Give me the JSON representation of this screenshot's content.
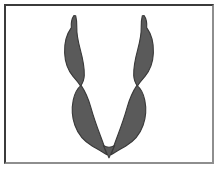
{
  "figure": {
    "background_color": "#ffffff",
    "frame": {
      "border_color_top_left": "#3b3b3b",
      "border_color_bottom_right": "#8e8e8e",
      "border_width": "2px",
      "inset": "4px"
    },
    "shape": {
      "fill_color": "#5a5a5a",
      "outline_color": "#3a3a3a",
      "outline_width": 1.2,
      "lobe_count": 4
    },
    "lobes": [
      {
        "name": "upper-left-lobe",
        "position": "upper left arm",
        "tip": "pointed, angled up and slightly left",
        "path": "M 72.5 10.5 C 70.2 13.8 69.4 18.6 69.8 23.5 C 64.8 30.5 62.2 40.5 62.6 51.0 C 63.0 61.5 66.4 70.5 71.8 77.0 C 74.8 80.6 77.6 83.5 79.6 87.2 C 82.0 84.0 83.4 80.2 83.6 75.8 C 83.9 67.5 82.0 57.5 79.2 47.0 C 77.0 38.6 75.4 30.0 75.6 23.2 C 75.8 18.2 75.2 13.9 74.4 10.6 Z"
      },
      {
        "name": "upper-right-lobe",
        "position": "upper right arm",
        "tip": "pointed, angled up and slightly right",
        "path": "M 147.5 10.5 C 149.8 13.8 150.6 18.6 150.2 23.5 C 155.2 30.5 157.8 40.5 157.4 51.0 C 157.0 61.5 153.6 70.5 148.2 77.0 C 145.2 80.6 142.4 83.5 140.4 87.2 C 138.0 84.0 136.6 80.2 136.4 75.8 C 136.1 67.5 138.0 57.5 140.8 47.0 C 143.0 38.6 144.6 30.0 144.4 23.2 C 144.2 18.2 144.8 13.9 145.6 10.6 Z"
      },
      {
        "name": "lower-left-lobe",
        "position": "lower left arm",
        "tip": "converges to bottom point",
        "path": "M 80.2 86.5 C 76.0 90.0 73.2 95.5 71.8 102.5 C 70.0 111.5 70.6 121.5 73.6 130.0 C 77.0 139.8 83.4 147.5 92.0 152.5 C 97.6 155.8 103.0 158.6 107.5 162.0 C 106.2 156.5 104.0 150.0 101.2 142.5 C 97.0 131.2 93.2 120.0 90.6 110.5 C 88.2 101.8 85.0 93.8 80.2 86.5 Z"
      },
      {
        "name": "lower-right-lobe",
        "position": "lower right arm",
        "tip": "converges to bottom point",
        "path": "M 139.8 86.5 C 144.0 90.0 146.8 95.5 148.2 102.5 C 150.0 111.5 149.4 121.5 146.4 130.0 C 143.0 139.8 136.6 147.5 128.0 152.5 C 122.4 155.8 117.0 158.6 112.5 162.0 C 113.8 156.5 116.0 150.0 118.8 142.5 C 123.0 131.2 126.8 120.0 129.4 110.5 C 131.8 101.8 135.0 93.8 139.8 86.5 Z"
      },
      {
        "name": "bottom-apex",
        "position": "bottom convergence point",
        "tip": "single merged point",
        "path": "M 104.0 152.0 L 110.0 165.5 L 116.0 152.0 C 112.0 154.5 108.0 154.5 104.0 152.0 Z"
      }
    ]
  }
}
